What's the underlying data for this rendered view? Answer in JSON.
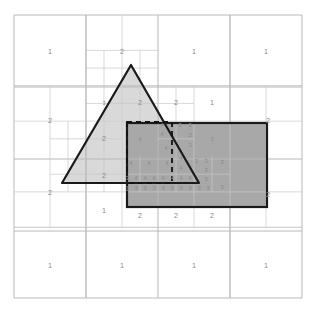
{
  "figure": {
    "type": "quadtree-subdivision-diagram",
    "caption": "",
    "canvas": {
      "width": 314,
      "height": 316
    },
    "domain": {
      "x0": 14,
      "y0": 15,
      "x1": 302,
      "y1": 298
    }
  },
  "colors": {
    "background": "#ffffff",
    "grid_coarse": "#b9b9b9",
    "grid_fine": "#c9c9c9",
    "triangle_fill": "#d9d9d9",
    "triangle_stroke": "#1a1a1a",
    "rect_fill": "#a8a8a8",
    "rect_stroke": "#1a1a1a",
    "dashed_stroke": "#111111",
    "label_text": "#8a8a8a",
    "caption_text": "#e8e8e8"
  },
  "shapes": {
    "triangle": {
      "name": "triangle",
      "fill": "#d9d9d9",
      "stroke": "#1a1a1a",
      "stroke_width": 2.2,
      "points": [
        [
          131,
          65
        ],
        [
          62,
          183
        ],
        [
          199,
          183
        ]
      ]
    },
    "rectangle": {
      "name": "gray-rectangle",
      "fill": "#a8a8a8",
      "stroke": "#1a1a1a",
      "stroke_width": 2.2,
      "x": 127,
      "y": 123,
      "width": 140,
      "height": 84
    },
    "dashed_rectangle": {
      "name": "dashed-query-rectangle",
      "stroke": "#111111",
      "stroke_width": 1.8,
      "dash": "5,4",
      "x": 127,
      "y": 122,
      "width": 45,
      "height": 61
    }
  },
  "grid": {
    "levels": [
      {
        "level": 1,
        "cell": 144,
        "note": "root split into 4 quadrants"
      },
      {
        "level": 2,
        "cell": 72,
        "note": "quadrants split where a shape boundary crosses"
      },
      {
        "level": 3,
        "cell": 36,
        "note": "third-level split along shape edges"
      },
      {
        "level": 4,
        "cell": 18,
        "note": "deepest split hugging triangle hypotenuse and rectangle edges"
      }
    ],
    "coarse_lines": [
      {
        "orientation": "h",
        "y": 15,
        "x0": 14,
        "x1": 302
      },
      {
        "orientation": "h",
        "y": 87,
        "x0": 14,
        "x1": 302
      },
      {
        "orientation": "h",
        "y": 159,
        "x0": 14,
        "x1": 302
      },
      {
        "orientation": "h",
        "y": 231,
        "x0": 14,
        "x1": 302
      },
      {
        "orientation": "h",
        "y": 298,
        "x0": 14,
        "x1": 302
      },
      {
        "orientation": "v",
        "x": 14,
        "y0": 15,
        "y1": 298
      },
      {
        "orientation": "v",
        "x": 86,
        "y0": 15,
        "y1": 298
      },
      {
        "orientation": "v",
        "x": 158,
        "y0": 15,
        "y1": 298
      },
      {
        "orientation": "v",
        "x": 230,
        "y0": 15,
        "y1": 298
      },
      {
        "orientation": "v",
        "x": 302,
        "y0": 15,
        "y1": 298
      }
    ]
  },
  "labels": [
    {
      "text": "1",
      "x": 50,
      "y": 54,
      "level": 1
    },
    {
      "text": "2",
      "x": 122,
      "y": 54,
      "level": 2
    },
    {
      "text": "1",
      "x": 194,
      "y": 54,
      "level": 1
    },
    {
      "text": "1",
      "x": 266,
      "y": 54,
      "level": 1
    },
    {
      "text": "2",
      "x": 50,
      "y": 123,
      "level": 2
    },
    {
      "text": "3",
      "x": 104,
      "y": 105,
      "level": 3
    },
    {
      "text": "2",
      "x": 140,
      "y": 105,
      "level": 2
    },
    {
      "text": "2",
      "x": 176,
      "y": 105,
      "level": 2
    },
    {
      "text": "1",
      "x": 212,
      "y": 105,
      "level": 1
    },
    {
      "text": "2",
      "x": 268,
      "y": 123,
      "level": 2
    },
    {
      "text": "2",
      "x": 104,
      "y": 141,
      "level": 2
    },
    {
      "text": "4",
      "x": 140,
      "y": 141,
      "level": 4
    },
    {
      "text": "4",
      "x": 162,
      "y": 127,
      "level": 4
    },
    {
      "text": "4",
      "x": 162,
      "y": 136,
      "level": 4
    },
    {
      "text": "4",
      "x": 166,
      "y": 150,
      "level": 4
    },
    {
      "text": "3",
      "x": 180,
      "y": 127,
      "level": 3
    },
    {
      "text": "3",
      "x": 190,
      "y": 127,
      "level": 3
    },
    {
      "text": "3",
      "x": 190,
      "y": 137,
      "level": 3
    },
    {
      "text": "3",
      "x": 190,
      "y": 147,
      "level": 3
    },
    {
      "text": "3",
      "x": 212,
      "y": 141,
      "level": 3
    },
    {
      "text": "2",
      "x": 104,
      "y": 178,
      "level": 2
    },
    {
      "text": "4",
      "x": 131,
      "y": 165,
      "level": 4
    },
    {
      "text": "4",
      "x": 149,
      "y": 165,
      "level": 4
    },
    {
      "text": "4",
      "x": 167,
      "y": 165,
      "level": 4
    },
    {
      "text": "4",
      "x": 181,
      "y": 160,
      "level": 4
    },
    {
      "text": "4",
      "x": 181,
      "y": 170,
      "level": 4
    },
    {
      "text": "3",
      "x": 196,
      "y": 163,
      "level": 3
    },
    {
      "text": "3",
      "x": 206,
      "y": 163,
      "level": 3
    },
    {
      "text": "3",
      "x": 206,
      "y": 172,
      "level": 3
    },
    {
      "text": "3",
      "x": 222,
      "y": 164,
      "level": 3
    },
    {
      "text": "3",
      "x": 222,
      "y": 189,
      "level": 3
    },
    {
      "text": "3",
      "x": 127,
      "y": 180,
      "level": 3
    },
    {
      "text": "4",
      "x": 136,
      "y": 180,
      "level": 4
    },
    {
      "text": "4",
      "x": 145,
      "y": 180,
      "level": 4
    },
    {
      "text": "4",
      "x": 154,
      "y": 180,
      "level": 4
    },
    {
      "text": "4",
      "x": 163,
      "y": 180,
      "level": 4
    },
    {
      "text": "4",
      "x": 172,
      "y": 180,
      "level": 4
    },
    {
      "text": "4",
      "x": 181,
      "y": 180,
      "level": 4
    },
    {
      "text": "4",
      "x": 190,
      "y": 180,
      "level": 4
    },
    {
      "text": "3",
      "x": 206,
      "y": 181,
      "level": 3
    },
    {
      "text": "1",
      "x": 127,
      "y": 191,
      "level": 1
    },
    {
      "text": "3",
      "x": 136,
      "y": 190,
      "level": 3
    },
    {
      "text": "3",
      "x": 145,
      "y": 190,
      "level": 3
    },
    {
      "text": "3",
      "x": 154,
      "y": 190,
      "level": 3
    },
    {
      "text": "3",
      "x": 163,
      "y": 190,
      "level": 3
    },
    {
      "text": "3",
      "x": 172,
      "y": 190,
      "level": 3
    },
    {
      "text": "3",
      "x": 181,
      "y": 190,
      "level": 3
    },
    {
      "text": "3",
      "x": 190,
      "y": 190,
      "level": 3
    },
    {
      "text": "3",
      "x": 199,
      "y": 190,
      "level": 3
    },
    {
      "text": "3",
      "x": 208,
      "y": 190,
      "level": 3
    },
    {
      "text": "2",
      "x": 50,
      "y": 195,
      "level": 2
    },
    {
      "text": "1",
      "x": 104,
      "y": 213,
      "level": 1
    },
    {
      "text": "2",
      "x": 140,
      "y": 218,
      "level": 2
    },
    {
      "text": "2",
      "x": 176,
      "y": 218,
      "level": 2
    },
    {
      "text": "2",
      "x": 212,
      "y": 218,
      "level": 2
    },
    {
      "text": "2",
      "x": 268,
      "y": 197,
      "level": 2
    },
    {
      "text": "1",
      "x": 50,
      "y": 268,
      "level": 1
    },
    {
      "text": "1",
      "x": 122,
      "y": 268,
      "level": 1
    },
    {
      "text": "1",
      "x": 194,
      "y": 268,
      "level": 1
    },
    {
      "text": "1",
      "x": 266,
      "y": 268,
      "level": 1
    }
  ]
}
